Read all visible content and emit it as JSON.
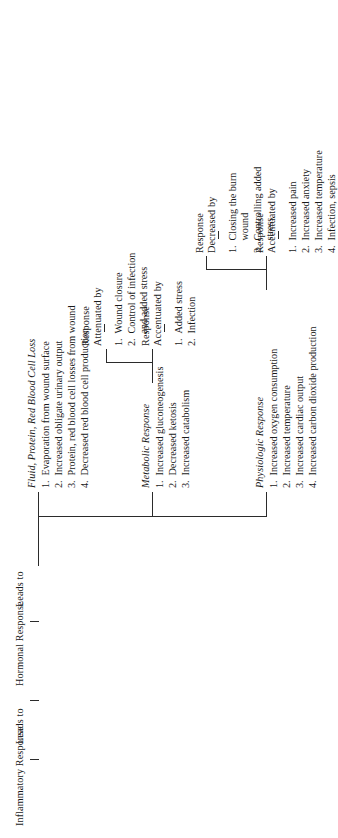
{
  "figure": {
    "orientation": "rotated-90-ccw",
    "line_color": "#2b2b2b",
    "stem": {
      "inflammatory_response": "Inflammatory Response",
      "leads_to_1": "Leads to",
      "hormonal_response": "Hormonal Response",
      "leads_to_2": "Leads to"
    },
    "branches": [
      {
        "title": "Physiologic Response",
        "items": [
          {
            "num": "1.",
            "text": "Increased oxygen consumption"
          },
          {
            "num": "2.",
            "text": "Increased temperature"
          },
          {
            "num": "3.",
            "text": "Increased cardiac output"
          },
          {
            "num": "4.",
            "text": "Increased carbon dioxide production"
          }
        ],
        "modifiers": [
          {
            "head_line_1": "Response",
            "head_line_2": "Accentuated by",
            "items": [
              {
                "num": "1.",
                "text": "Increased pain",
                "cont": ""
              },
              {
                "num": "2.",
                "text": "Increased anxiety",
                "cont": ""
              },
              {
                "num": "3.",
                "text": "Increased temperature",
                "cont": ""
              },
              {
                "num": "4.",
                "text": "Infection, sepsis",
                "cont": ""
              }
            ]
          },
          {
            "head_line_1": "Response",
            "head_line_2": "Decreased by",
            "items": [
              {
                "num": "1.",
                "text": "Closing the burn",
                "cont": "wound"
              },
              {
                "num": "2.",
                "text": "Controlling added",
                "cont": "stress"
              }
            ]
          }
        ]
      },
      {
        "title": "Metabolic Response",
        "items": [
          {
            "num": "1.",
            "text": "Increased gluconeogenesis"
          },
          {
            "num": "2.",
            "text": "Decreased ketosis"
          },
          {
            "num": "3.",
            "text": "Increased catabolism"
          }
        ],
        "modifiers": [
          {
            "head_line_1": "Response",
            "head_line_2": "Accentuated by",
            "items": [
              {
                "num": "1.",
                "text": "Added stress",
                "cont": ""
              },
              {
                "num": "2.",
                "text": "Infection",
                "cont": ""
              }
            ]
          },
          {
            "head_line_1": "Response",
            "head_line_2": "Attenuated by",
            "items": [
              {
                "num": "1.",
                "text": "Wound closure",
                "cont": ""
              },
              {
                "num": "2.",
                "text": "Control of infection",
                "cont": "and added stress"
              }
            ]
          }
        ]
      },
      {
        "title": "Fluid, Protein, Red Blood Cell Loss",
        "items": [
          {
            "num": "1.",
            "text": "Evaporation from wound surface"
          },
          {
            "num": "2.",
            "text": "Increased obligate urinary output"
          },
          {
            "num": "3.",
            "text": "Protein, red blood cell losses from wound"
          },
          {
            "num": "4.",
            "text": "Decreased red blood cell production"
          }
        ],
        "modifiers": []
      }
    ]
  }
}
